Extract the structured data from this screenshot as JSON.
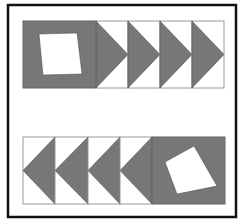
{
  "diagram": {
    "title": "",
    "colors": {
      "background": "#ffffff",
      "frame": "#111111",
      "fill": "#777777",
      "cell_border": "#999999",
      "inner": "#ffffff"
    },
    "frame": {
      "x": 8,
      "y": 5,
      "w": 228,
      "h": 212
    },
    "rows": [
      {
        "name": "top-row",
        "y": 21,
        "h": 67,
        "square": {
          "x": 23,
          "w": 73,
          "inner_quad": [
            [
              39,
              34
            ],
            [
              77,
              33
            ],
            [
              82,
              74
            ],
            [
              43,
              75
            ]
          ]
        },
        "arrows": [
          {
            "x": 96,
            "w": 32,
            "direction": "right"
          },
          {
            "x": 128,
            "w": 32,
            "direction": "right"
          },
          {
            "x": 160,
            "w": 32,
            "direction": "right"
          },
          {
            "x": 192,
            "w": 32,
            "direction": "right"
          }
        ]
      },
      {
        "name": "bottom-row",
        "y": 137,
        "h": 67,
        "square": {
          "x": 152,
          "w": 73,
          "inner_quad": [
            [
              165,
              162
            ],
            [
              194,
              146
            ],
            [
              217,
              186
            ],
            [
              177,
              194
            ]
          ]
        },
        "arrows": [
          {
            "x": 23,
            "w": 32,
            "direction": "left"
          },
          {
            "x": 55,
            "w": 33,
            "direction": "left"
          },
          {
            "x": 88,
            "w": 32,
            "direction": "left"
          },
          {
            "x": 120,
            "w": 32,
            "direction": "left"
          }
        ]
      }
    ]
  }
}
